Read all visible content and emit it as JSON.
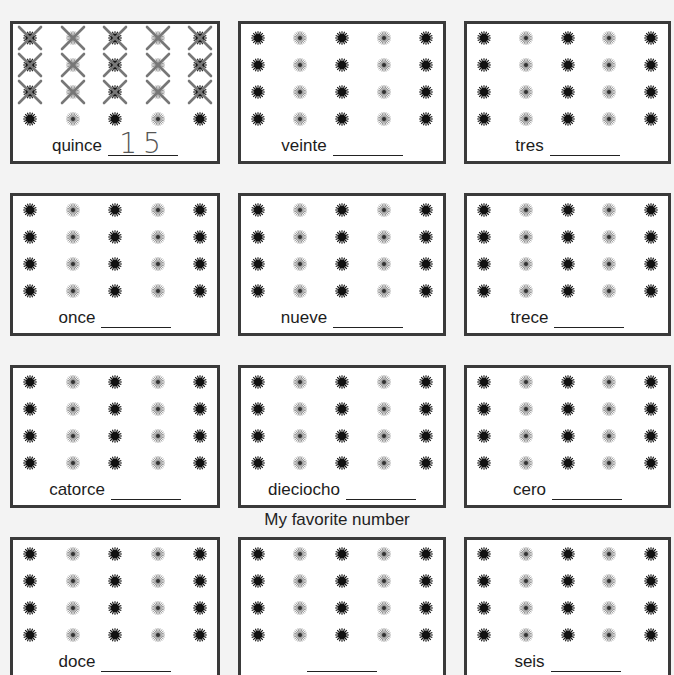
{
  "worksheet": {
    "subtitle": "My favorite number",
    "colors": {
      "card_border": "#3a3a3a",
      "dot_dark": "#111111",
      "dot_light": "#777777",
      "cross_mark": "#777777"
    },
    "grid": {
      "rows_per_card": 4,
      "cols_per_card": 5,
      "dot_pattern": [
        "dark",
        "light",
        "dark",
        "light",
        "dark"
      ]
    },
    "cards": [
      {
        "word": "quince",
        "answer": "15",
        "crossed_rows": 3
      },
      {
        "word": "veinte",
        "answer": "",
        "crossed_rows": 0
      },
      {
        "word": "tres",
        "answer": "",
        "crossed_rows": 0
      },
      {
        "word": "once",
        "answer": "",
        "crossed_rows": 0
      },
      {
        "word": "nueve",
        "answer": "",
        "crossed_rows": 0
      },
      {
        "word": "trece",
        "answer": "",
        "crossed_rows": 0
      },
      {
        "word": "catorce",
        "answer": "",
        "crossed_rows": 0
      },
      {
        "word": "dieciocho",
        "answer": "",
        "crossed_rows": 0
      },
      {
        "word": "cero",
        "answer": "",
        "crossed_rows": 0
      },
      {
        "word": "doce",
        "answer": "",
        "crossed_rows": 0
      },
      {
        "word": "",
        "answer": "",
        "crossed_rows": 0
      },
      {
        "word": "seis",
        "answer": "",
        "crossed_rows": 0
      }
    ]
  }
}
